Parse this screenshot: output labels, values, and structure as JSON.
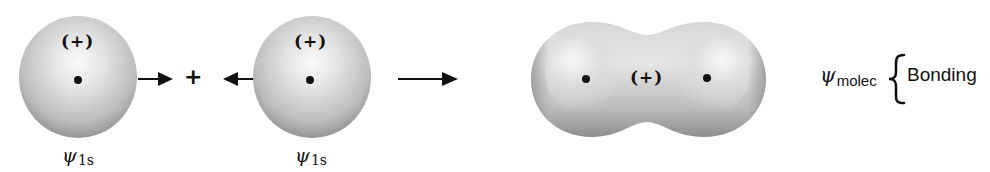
{
  "figure": {
    "atom_left": {
      "sign": "(+)",
      "label_symbol": "ψ",
      "label_subscript": "1s"
    },
    "operator": "+",
    "atom_right": {
      "sign": "(+)",
      "label_symbol": "ψ",
      "label_subscript": "1s"
    },
    "molecule": {
      "sign": "(+)"
    },
    "result": {
      "symbol": "ψ",
      "subscript": "molec",
      "type_label": "Bonding"
    },
    "colors": {
      "orbital_light": "#f4f4f4",
      "orbital_dark": "#8a8a8a",
      "ink": "#111111"
    }
  }
}
